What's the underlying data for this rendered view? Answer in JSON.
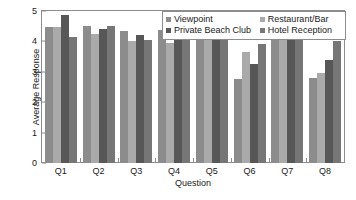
{
  "chart_data": {
    "type": "bar",
    "title": "",
    "xlabel": "Question",
    "ylabel": "Average Response",
    "categories": [
      "Q1",
      "Q2",
      "Q3",
      "Q4",
      "Q5",
      "Q6",
      "Q7",
      "Q8"
    ],
    "ylim": [
      0,
      5
    ],
    "yticks": [
      0,
      1,
      2,
      3,
      4,
      5
    ],
    "ytick_labels": [
      "0",
      "1",
      "2",
      "3",
      "4",
      "5"
    ],
    "grid": false,
    "legend_position": "top-right",
    "series": [
      {
        "name": "Viewpoint",
        "color": "#8c8c8c",
        "values": [
          4.47,
          4.5,
          4.35,
          4.37,
          4.47,
          2.78,
          4.25,
          2.8
        ]
      },
      {
        "name": "Restaurant/Bar",
        "color": "#aaaaaa",
        "values": [
          4.47,
          4.25,
          4.02,
          3.95,
          4.25,
          3.65,
          4.35,
          2.95
        ]
      },
      {
        "name": "Private Beach Club",
        "color": "#575757",
        "values": [
          4.87,
          4.42,
          4.2,
          4.43,
          4.35,
          3.25,
          4.37,
          3.4
        ]
      },
      {
        "name": "Hotel Reception",
        "color": "#767676",
        "values": [
          4.15,
          4.52,
          4.05,
          4.3,
          4.52,
          3.92,
          4.5,
          4.0
        ]
      }
    ]
  }
}
